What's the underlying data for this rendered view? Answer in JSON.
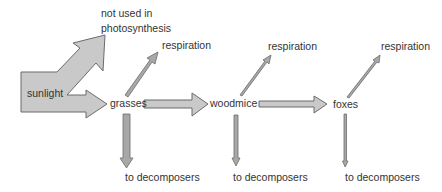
{
  "diagram": {
    "type": "energy-flow food chain",
    "colors": {
      "arrow_fill": "#c9c9c9",
      "arrow_stroke": "#6b6b6b",
      "text": "#333333",
      "background": "#ffffff"
    },
    "source": {
      "label": "sunlight"
    },
    "loss_top": {
      "line1": "not used in",
      "line2": "photosynthesis"
    },
    "nodes": [
      {
        "label": "grasses"
      },
      {
        "label": "woodmice"
      },
      {
        "label": "foxes"
      }
    ],
    "respiration": [
      {
        "label": "respiration"
      },
      {
        "label": "respiration"
      },
      {
        "label": "respiration"
      }
    ],
    "decomposers": [
      {
        "label": "to decomposers"
      },
      {
        "label": "to decomposers"
      },
      {
        "label": "to decomposers"
      }
    ]
  }
}
